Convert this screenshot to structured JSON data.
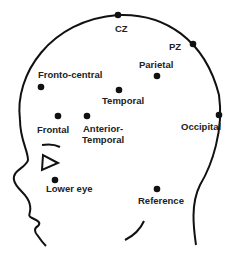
{
  "diagram": {
    "type": "electrode-placement-head-side-view",
    "colors": {
      "line": "#111111",
      "dot": "#111111",
      "text": "#222222",
      "background": "#ffffff"
    },
    "electrodes": [
      {
        "id": "cz",
        "label": "CZ",
        "dot": [
          118,
          15
        ]
      },
      {
        "id": "pz",
        "label": "PZ",
        "dot": [
          193,
          44
        ]
      },
      {
        "id": "parietal",
        "label": "Parietal",
        "dot": [
          157,
          76
        ]
      },
      {
        "id": "fronto-central",
        "label": "Fronto-central",
        "dot": [
          41,
          87
        ]
      },
      {
        "id": "temporal",
        "label": "Temporal",
        "dot": [
          119,
          90
        ]
      },
      {
        "id": "frontal",
        "label": "Frontal",
        "dot": [
          58,
          116
        ]
      },
      {
        "id": "anterior-temporal",
        "label_line1": "Anterior-",
        "label_line2": "Temporal",
        "dot": [
          87,
          116
        ]
      },
      {
        "id": "occipital",
        "label": "Occipital",
        "dot": [
          219,
          115
        ]
      },
      {
        "id": "lower-eye",
        "label": "Lower eye",
        "dot": [
          55,
          180
        ]
      },
      {
        "id": "reference",
        "label": "Reference",
        "dot": [
          157,
          189
        ]
      }
    ]
  }
}
